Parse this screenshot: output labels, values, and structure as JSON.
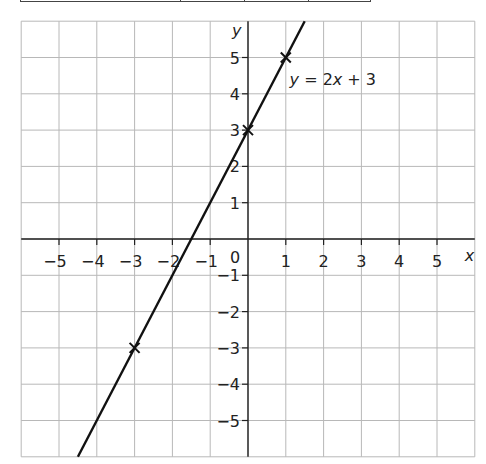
{
  "table_fragment": {
    "visible": true,
    "column_dividers_px": [
      180,
      244,
      308
    ]
  },
  "chart_data": {
    "type": "line",
    "title": "",
    "xlabel": "x",
    "ylabel": "y",
    "xlim": [
      -6,
      6
    ],
    "ylim": [
      -6,
      6
    ],
    "grid": true,
    "x_ticks": [
      -5,
      -4,
      -3,
      -2,
      -1,
      1,
      2,
      3,
      4,
      5
    ],
    "y_ticks": [
      -5,
      -4,
      -3,
      -2,
      -1,
      1,
      2,
      3,
      4,
      5
    ],
    "origin_label": "0",
    "series": [
      {
        "name": "y = 2x + 3",
        "equation": "y = 2x + 3",
        "slope": 2,
        "intercept": 3,
        "x": [
          -4.5,
          1.5
        ],
        "y": [
          -6,
          6
        ]
      }
    ],
    "marked_points": [
      {
        "x": -3,
        "y": -3
      },
      {
        "x": 0,
        "y": 3
      },
      {
        "x": 1,
        "y": 5
      }
    ],
    "annotations": [
      {
        "text_parts": [
          "y",
          " = 2",
          "x",
          " + 3"
        ],
        "x": 1.1,
        "y": 4.4
      }
    ]
  }
}
